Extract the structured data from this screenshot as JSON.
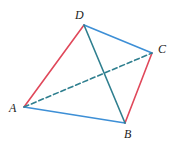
{
  "diagram": {
    "type": "tetrahedron",
    "colors": {
      "red_edge": "#e0485a",
      "blue_edge": "#3d8fd6",
      "teal_edge": "#2f7f8f",
      "label": "#222222"
    },
    "vertices": {
      "A": {
        "label": "A",
        "x": 24,
        "y": 107,
        "label_x": 9,
        "label_y": 112
      },
      "B": {
        "label": "B",
        "x": 125,
        "y": 123,
        "label_x": 124,
        "label_y": 138
      },
      "C": {
        "label": "C",
        "x": 152,
        "y": 53,
        "label_x": 158,
        "label_y": 53
      },
      "D": {
        "label": "D",
        "x": 84,
        "y": 25,
        "label_x": 75,
        "label_y": 19
      }
    },
    "edges": [
      {
        "id": "AD",
        "from": "A",
        "to": "D",
        "color": "red_edge",
        "style": "solid"
      },
      {
        "id": "CB",
        "from": "C",
        "to": "B",
        "color": "red_edge",
        "style": "solid"
      },
      {
        "id": "DC",
        "from": "D",
        "to": "C",
        "color": "blue_edge",
        "style": "solid"
      },
      {
        "id": "AB",
        "from": "A",
        "to": "B",
        "color": "blue_edge",
        "style": "solid"
      },
      {
        "id": "DB",
        "from": "D",
        "to": "B",
        "color": "teal_edge",
        "style": "solid"
      },
      {
        "id": "AC",
        "from": "A",
        "to": "C",
        "color": "teal_edge",
        "style": "dashed"
      }
    ]
  }
}
